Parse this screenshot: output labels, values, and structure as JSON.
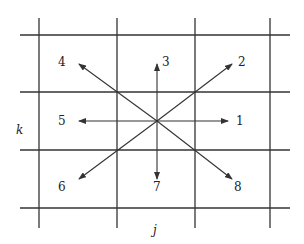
{
  "diagram": {
    "type": "lattice-directions",
    "colors": {
      "line": "#333333",
      "text": "#222222",
      "background": "#ffffff"
    },
    "axis_labels": {
      "horizontal": "j",
      "vertical": "k"
    },
    "grid": {
      "vertical_x": [
        39,
        117,
        195,
        270
      ],
      "horizontal_y": [
        35,
        92,
        150,
        208
      ],
      "v_extent": [
        18,
        228
      ],
      "h_extent": [
        20,
        290
      ]
    },
    "center": {
      "x": 157,
      "y": 121
    },
    "directions": [
      {
        "id": "1",
        "label": "1",
        "tip": [
          228,
          121
        ],
        "label_pos": [
          236,
          125
        ]
      },
      {
        "id": "2",
        "label": "2",
        "tip": [
          232,
          64
        ],
        "label_pos": [
          238,
          66
        ]
      },
      {
        "id": "3",
        "label": "3",
        "tip": [
          157,
          64
        ],
        "label_pos": [
          162,
          66
        ]
      },
      {
        "id": "4",
        "label": "4",
        "tip": [
          79,
          64
        ],
        "label_pos": [
          58,
          66
        ]
      },
      {
        "id": "5",
        "label": "5",
        "tip": [
          79,
          121
        ],
        "label_pos": [
          58,
          125
        ]
      },
      {
        "id": "6",
        "label": "6",
        "tip": [
          79,
          179
        ],
        "label_pos": [
          58,
          191
        ]
      },
      {
        "id": "7",
        "label": "7",
        "tip": [
          157,
          179
        ],
        "label_pos": [
          153,
          191
        ]
      },
      {
        "id": "8",
        "label": "8",
        "tip": [
          232,
          179
        ],
        "label_pos": [
          234,
          191
        ]
      }
    ],
    "axis_label_pos": {
      "j": [
        153,
        234
      ],
      "k": [
        16,
        134
      ]
    }
  }
}
